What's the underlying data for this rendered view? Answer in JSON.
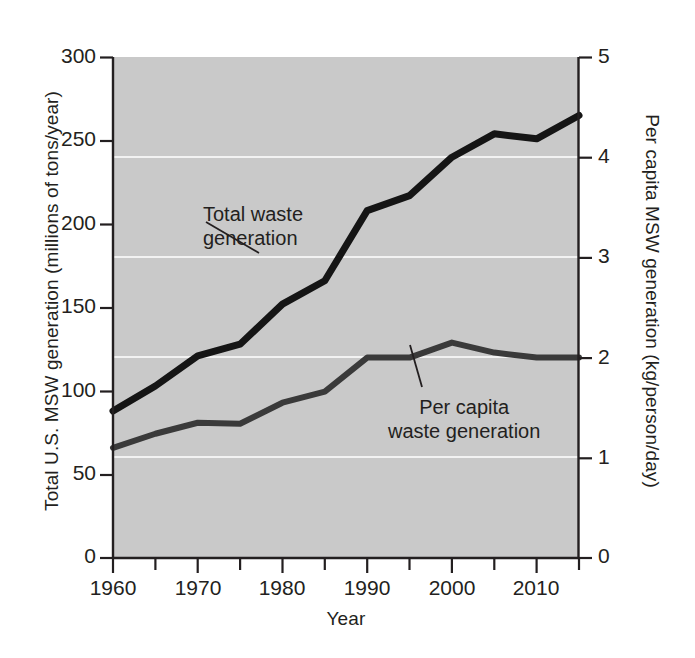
{
  "chart_data": {
    "type": "line",
    "title": "",
    "xlabel": "Year",
    "ylabel": "Total U.S. MSW generation (millions of tons/year)",
    "ylabel_right": "Per capita MSW generation (kg/person/day)",
    "xlim": [
      1960,
      2015
    ],
    "ylim": [
      0,
      300
    ],
    "ylim_right": [
      0,
      5
    ],
    "xticks": [
      1960,
      1970,
      1980,
      1990,
      2000,
      2010
    ],
    "xtick_labels": [
      "1960",
      "1970",
      "1980",
      "1990",
      "2000",
      "2010"
    ],
    "xminor_ticks": [
      1965,
      1975,
      1985,
      1995,
      2005,
      2015
    ],
    "yticks": [
      0,
      50,
      100,
      150,
      200,
      250,
      300
    ],
    "ytick_labels": [
      "0",
      "50",
      "100",
      "150",
      "200",
      "250",
      "300"
    ],
    "yticks_right": [
      0,
      1,
      2,
      3,
      4,
      5
    ],
    "ytick_labels_right": [
      "0",
      "1",
      "2",
      "3",
      "4",
      "5"
    ],
    "grid": true,
    "gridlines_at_right_axis": [
      1,
      2,
      3,
      4
    ],
    "legend": "none",
    "plot_bgcolor": "#c9c9c9",
    "series": [
      {
        "name": "Total waste generation",
        "axis": "left",
        "unit": "millions of tons/year",
        "color": "#151515",
        "annotation": "Total waste\ngeneration",
        "x": [
          1960,
          1965,
          1970,
          1975,
          1980,
          1985,
          1990,
          1995,
          2000,
          2005,
          2010,
          2015
        ],
        "values": [
          88,
          103,
          121,
          128,
          152,
          166,
          208,
          217,
          240,
          254,
          251,
          265
        ]
      },
      {
        "name": "Per capita waste generation",
        "axis": "right",
        "unit": "kg/person/day",
        "color": "#3a3a3a",
        "annotation": "Per capita\nwaste generation",
        "x": [
          1960,
          1965,
          1970,
          1975,
          1980,
          1985,
          1990,
          1995,
          2000,
          2005,
          2010,
          2015
        ],
        "values": [
          1.1,
          1.24,
          1.35,
          1.34,
          1.55,
          1.66,
          2.0,
          2.0,
          2.15,
          2.05,
          2.0,
          2.0
        ]
      }
    ]
  },
  "axes": {
    "y_left_title": "Total U.S. MSW generation (millions of tons/year)",
    "y_right_title": "Per capita MSW generation (kg/person/day)",
    "x_title": "Year"
  }
}
